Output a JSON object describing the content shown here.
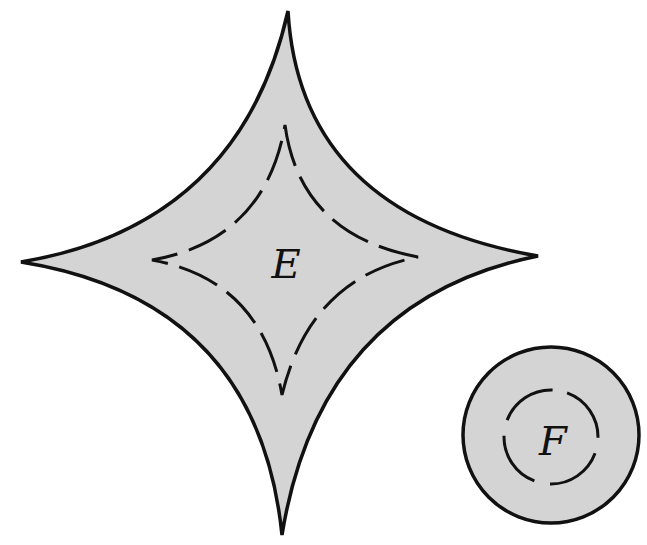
{
  "figure": {
    "colors": {
      "fill": "#d4d4d4",
      "stroke": "#111111",
      "background": "#ffffff"
    },
    "shapes": [
      {
        "id": "E",
        "type": "astroid",
        "label": "E",
        "outer_tips": {
          "top": [
            288,
            11
          ],
          "right": [
            538,
            256
          ],
          "bottom": [
            282,
            535
          ],
          "left": [
            21,
            262
          ]
        },
        "inner_boundary": "dashed",
        "inner_tips": {
          "top": [
            285,
            125
          ],
          "right": [
            418,
            257
          ],
          "bottom": [
            282,
            395
          ],
          "left": [
            152,
            260
          ]
        }
      },
      {
        "id": "F",
        "type": "circle",
        "label": "F",
        "center": [
          551,
          435
        ],
        "outer_radius": 88,
        "inner_radius": 48,
        "inner_boundary": "dashed"
      }
    ]
  }
}
